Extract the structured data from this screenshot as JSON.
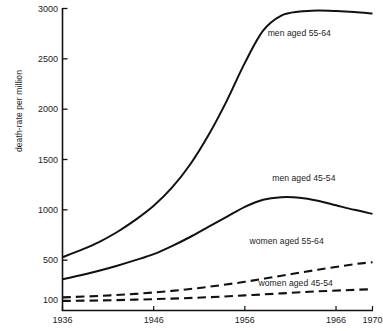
{
  "chart_data": {
    "type": "line",
    "title": "",
    "xlabel": "",
    "ylabel": "death-rate per million",
    "xlim": [
      1936,
      1970
    ],
    "ylim": [
      0,
      3000
    ],
    "grid": false,
    "legend_position": "inline-annotations",
    "x_ticks": [
      1936,
      1946,
      1956,
      1966,
      1970
    ],
    "x_tick_labels": [
      "1936",
      "1946",
      "1956",
      "1966",
      "1970"
    ],
    "y_ticks": [
      100,
      500,
      1000,
      1500,
      2000,
      2500,
      3000
    ],
    "y_tick_labels": [
      "100",
      "500",
      "1000",
      "1500",
      "2000",
      "2500",
      "3000"
    ],
    "series": [
      {
        "name": "men aged 55-64",
        "style": "solid",
        "label": "men aged 55-64",
        "x": [
          1936,
          1938,
          1940,
          1942,
          1944,
          1946,
          1948,
          1950,
          1952,
          1954,
          1956,
          1958,
          1960,
          1962,
          1964,
          1966,
          1968,
          1970
        ],
        "values": [
          530,
          600,
          680,
          780,
          900,
          1040,
          1220,
          1450,
          1740,
          2080,
          2460,
          2780,
          2930,
          2970,
          2980,
          2975,
          2965,
          2950
        ]
      },
      {
        "name": "men aged 45-54",
        "style": "solid",
        "label": "men aged 45-54",
        "x": [
          1936,
          1938,
          1940,
          1942,
          1944,
          1946,
          1948,
          1950,
          1952,
          1954,
          1956,
          1958,
          1960,
          1962,
          1964,
          1966,
          1968,
          1970
        ],
        "values": [
          310,
          350,
          395,
          445,
          500,
          560,
          640,
          730,
          830,
          930,
          1030,
          1100,
          1125,
          1120,
          1090,
          1045,
          1000,
          960
        ]
      },
      {
        "name": "women aged 55-64",
        "style": "dashed",
        "label": "women aged 55-64",
        "x": [
          1936,
          1940,
          1944,
          1948,
          1952,
          1956,
          1960,
          1964,
          1968,
          1970
        ],
        "values": [
          130,
          145,
          165,
          195,
          235,
          285,
          345,
          405,
          460,
          480
        ]
      },
      {
        "name": "women aged 45-54",
        "style": "dashed",
        "label": "women aged 45-54",
        "x": [
          1936,
          1940,
          1944,
          1948,
          1952,
          1956,
          1960,
          1964,
          1968,
          1970
        ],
        "values": [
          95,
          100,
          108,
          118,
          132,
          150,
          170,
          190,
          205,
          212
        ]
      }
    ],
    "annotations": [
      {
        "text": "men aged 55-64",
        "x": 1958.5,
        "y": 2760
      },
      {
        "text": "men aged 45-54",
        "x": 1959.0,
        "y": 1320
      },
      {
        "text": "women aged 55-64",
        "x": 1956.5,
        "y": 690
      },
      {
        "text": "women aged 45-54",
        "x": 1957.5,
        "y": 270
      }
    ],
    "colors": {
      "line": "#111111",
      "axis": "#111111",
      "background": "#ffffff",
      "text": "#1c1c1c"
    }
  }
}
